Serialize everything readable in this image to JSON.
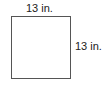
{
  "diagram": {
    "shape": "square",
    "top_side_label": "13 in.",
    "right_side_label": "13 in.",
    "stroke_color": "#555555"
  }
}
